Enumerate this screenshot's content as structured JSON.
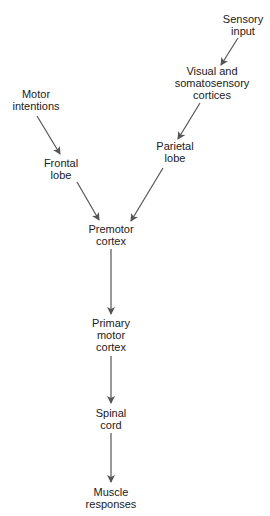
{
  "diagram": {
    "type": "flowchart",
    "line_color": "#555555",
    "text_color": "#1a1a1a",
    "background": "#ffffff",
    "nodes": [
      {
        "id": "sensory-input",
        "lines": [
          "Sensory",
          "input"
        ]
      },
      {
        "id": "visual-somatosensory",
        "lines": [
          "Visual and",
          "somatosensory",
          "cortices"
        ]
      },
      {
        "id": "parietal-lobe",
        "lines": [
          "Parietal",
          "lobe"
        ]
      },
      {
        "id": "motor-intentions",
        "lines": [
          "Motor",
          "intentions"
        ]
      },
      {
        "id": "frontal-lobe",
        "lines": [
          "Frontal",
          "lobe"
        ]
      },
      {
        "id": "premotor-cortex",
        "lines": [
          "Premotor",
          "cortex"
        ]
      },
      {
        "id": "primary-motor-cortex",
        "lines": [
          "Primary",
          "motor",
          "cortex"
        ]
      },
      {
        "id": "spinal-cord",
        "lines": [
          "Spinal",
          "cord"
        ]
      },
      {
        "id": "muscle-responses",
        "lines": [
          "Muscle",
          "responses"
        ]
      }
    ],
    "edges": [
      {
        "from": "sensory-input",
        "to": "visual-somatosensory"
      },
      {
        "from": "visual-somatosensory",
        "to": "parietal-lobe"
      },
      {
        "from": "parietal-lobe",
        "to": "premotor-cortex"
      },
      {
        "from": "motor-intentions",
        "to": "frontal-lobe"
      },
      {
        "from": "frontal-lobe",
        "to": "premotor-cortex"
      },
      {
        "from": "premotor-cortex",
        "to": "primary-motor-cortex"
      },
      {
        "from": "primary-motor-cortex",
        "to": "spinal-cord"
      },
      {
        "from": "spinal-cord",
        "to": "muscle-responses"
      }
    ]
  }
}
